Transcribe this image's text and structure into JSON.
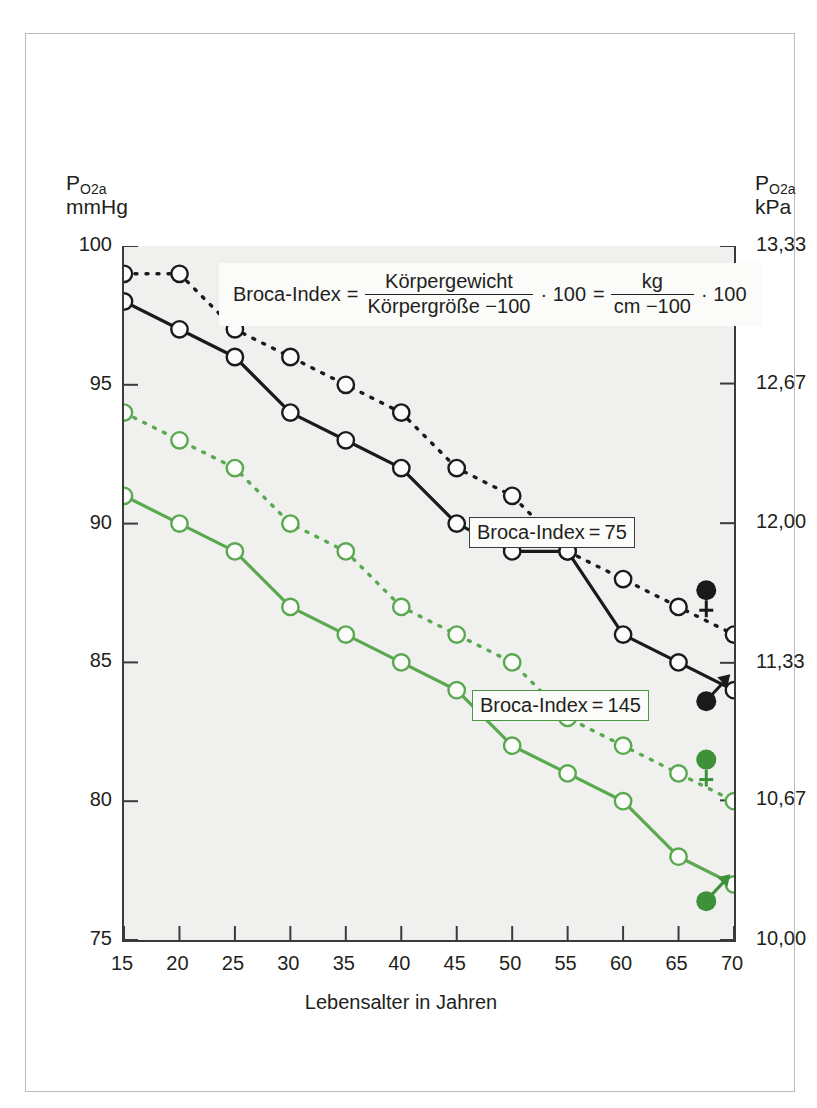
{
  "figure": {
    "x_axis_title": "Lebensalter in Jahren",
    "y_left_title_main": "P",
    "y_left_title_sub": "O2a",
    "y_left_title_unit": "mmHg",
    "y_right_title_main": "P",
    "y_right_title_sub": "O2a",
    "y_right_title_unit": "kPa"
  },
  "formula": {
    "lhs": "Broca-Index",
    "eq1": "=",
    "num1": "Körpergewicht",
    "den1": "Körpergröße −100",
    "mult1": "· 100",
    "eq2": "=",
    "num2": "kg",
    "den2": "cm −100",
    "mult2": "· 100"
  },
  "annotations": {
    "broca75": "Broca-Index = 75",
    "broca145": "Broca-Index = 145"
  },
  "legend_symbols": [
    {
      "name": "female-black",
      "glyph": "♀",
      "color": "#1a1a1a"
    },
    {
      "name": "male-black",
      "glyph": "♂",
      "color": "#1a1a1a"
    },
    {
      "name": "female-green",
      "glyph": "♀",
      "color": "#3f9139"
    },
    {
      "name": "male-green",
      "glyph": "♂",
      "color": "#3f9139"
    }
  ],
  "colors": {
    "black_series": "#1a1a1a",
    "green_series": "#5aa84f",
    "green_dark": "#3f9139",
    "plot_bg": "#f0f1ef",
    "frame": "#3a3a3a",
    "outer_border": "#b9bbbd"
  },
  "chart_data": {
    "type": "line",
    "title": "",
    "xlabel": "Lebensalter in Jahren",
    "ylabel": "P_O2a mmHg",
    "ylabel_right": "P_O2a kPa",
    "grid": false,
    "legend_position": "inline-right",
    "x": [
      15,
      20,
      25,
      30,
      35,
      40,
      45,
      50,
      55,
      60,
      65,
      70
    ],
    "xlim": [
      15,
      70
    ],
    "ylim": [
      75,
      100
    ],
    "x_ticks": [
      "15",
      "20",
      "25",
      "30",
      "35",
      "40",
      "45",
      "50",
      "55",
      "60",
      "65",
      "70"
    ],
    "y_ticks_left": [
      "100",
      "95",
      "90",
      "85",
      "80",
      "75"
    ],
    "y_ticks_left_values": [
      100,
      95,
      90,
      85,
      80,
      75
    ],
    "y_ticks_right": [
      "13,33",
      "12,67",
      "12,00",
      "11,33",
      "10,67",
      "10,00"
    ],
    "y_ticks_right_values": [
      13.33,
      12.67,
      12.0,
      11.33,
      10.67,
      10.0
    ],
    "series": [
      {
        "name": "Broca-Index = 75, weiblich",
        "label": "Broca-Index=75",
        "sex": "female",
        "color": "#1a1a1a",
        "style": "dashed",
        "marker": "open-circle",
        "values": [
          99,
          99,
          97,
          96,
          95,
          94,
          92,
          91,
          89,
          88,
          87,
          86
        ]
      },
      {
        "name": "Broca-Index = 75, männlich",
        "label": "Broca-Index=75",
        "sex": "male",
        "color": "#1a1a1a",
        "style": "solid",
        "marker": "open-circle",
        "values": [
          98,
          97,
          96,
          94,
          93,
          92,
          90,
          89,
          89,
          86,
          85,
          84
        ]
      },
      {
        "name": "Broca-Index = 145, weiblich",
        "label": "Broca-Index=145",
        "sex": "female",
        "color": "#5aa84f",
        "style": "dashed",
        "marker": "open-circle",
        "values": [
          94,
          93,
          92,
          90,
          89,
          87,
          86,
          85,
          83,
          82,
          81,
          80
        ]
      },
      {
        "name": "Broca-Index = 145, männlich",
        "label": "Broca-Index=145",
        "sex": "male",
        "color": "#5aa84f",
        "style": "solid",
        "marker": "open-circle",
        "values": [
          91,
          90,
          89,
          87,
          86,
          85,
          84,
          82,
          81,
          80,
          78,
          77
        ]
      }
    ]
  }
}
